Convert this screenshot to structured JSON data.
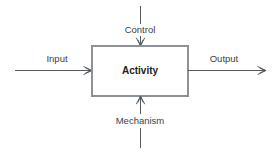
{
  "diagram": {
    "type": "idef0-activity",
    "activity": {
      "label": "Activity",
      "box": {
        "x": 92,
        "y": 46,
        "width": 96,
        "height": 50
      }
    },
    "colors": {
      "background": "#ffffff",
      "line": "#555a5e",
      "box_border": "#8d9296",
      "box_fill": "#ffffff",
      "label_text": "#3d4145",
      "title_text": "#1d2023"
    },
    "arrows": [
      {
        "name": "input",
        "label": "Input",
        "direction": "left-to-right",
        "role": "input",
        "label_x": 57,
        "label_y": 59,
        "line": {
          "x1": 15,
          "y1": 70,
          "x2": 92,
          "y2": 70
        },
        "head_at": {
          "x": 92,
          "y": 70
        }
      },
      {
        "name": "control",
        "label": "Control",
        "direction": "top-to-bottom",
        "role": "control",
        "label_x": 140,
        "label_y": 30,
        "line": {
          "x1": 140,
          "y1": 6,
          "x2": 140,
          "y2": 46
        },
        "head_at": {
          "x": 140,
          "y": 46
        }
      },
      {
        "name": "output",
        "label": "Output",
        "direction": "left-to-right",
        "role": "output",
        "label_x": 224,
        "label_y": 59,
        "line": {
          "x1": 188,
          "y1": 70,
          "x2": 266,
          "y2": 70
        },
        "head_at": {
          "x": 266,
          "y": 70
        }
      },
      {
        "name": "mechanism",
        "label": "Mechanism",
        "direction": "bottom-to-top",
        "role": "mechanism",
        "label_x": 140,
        "label_y": 121,
        "line": {
          "x1": 140,
          "y1": 148,
          "x2": 140,
          "y2": 96
        },
        "head_at": {
          "x": 140,
          "y": 96
        }
      }
    ]
  }
}
